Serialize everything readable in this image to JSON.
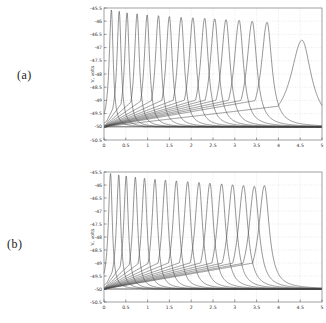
{
  "figure": {
    "background": "#ffffff"
  },
  "colors": {
    "curve": "#4f4f4f",
    "baseline": "#3f3f3f",
    "grid": "#d9d9d9",
    "axis": "#7a7a7a",
    "tick": "#555555",
    "text": "#333333"
  },
  "chart_data": [
    {
      "type": "line",
      "panel_label": "(a)",
      "title": "",
      "xlabel": "",
      "ylabel": "V, volts",
      "xlim": [
        0,
        5
      ],
      "ylim": [
        -50.5,
        -45.5
      ],
      "grid": true,
      "x_tick_values": [
        0,
        0.5,
        1,
        1.5,
        2,
        2.5,
        3,
        3.5,
        4,
        4.5,
        5
      ],
      "x_tick_labels": [
        "0",
        "0.5",
        "1",
        "1.5",
        "2",
        "2.5",
        "3",
        "3.5",
        "4",
        "4.5",
        "5"
      ],
      "y_tick_values": [
        -45.5,
        -46,
        -46.5,
        -47,
        -47.5,
        -48,
        -48.5,
        -49,
        -49.5,
        -50,
        -50.5
      ],
      "y_tick_labels": [
        "-45.5",
        "-46",
        "-46.5",
        "-47",
        "-47.5",
        "-48",
        "-48.5",
        "-49",
        "-49.5",
        "-50",
        "-50.5"
      ],
      "baseline_dB": -50,
      "width_model": {
        "core": [
          0.055,
          0.028
        ],
        "right": [
          0.045,
          0.024
        ],
        "ramp_fraction": 0.27
      },
      "peaks": [
        {
          "x": 0.17,
          "peak_dB": -45.57
        },
        {
          "x": 0.35,
          "peak_dB": -45.62
        },
        {
          "x": 0.53,
          "peak_dB": -45.68
        },
        {
          "x": 0.76,
          "peak_dB": -45.72
        },
        {
          "x": 0.99,
          "peak_dB": -45.76
        },
        {
          "x": 1.25,
          "peak_dB": -45.79
        },
        {
          "x": 1.5,
          "peak_dB": -45.82
        },
        {
          "x": 1.77,
          "peak_dB": -45.85
        },
        {
          "x": 2.04,
          "peak_dB": -45.87
        },
        {
          "x": 2.31,
          "peak_dB": -45.89
        },
        {
          "x": 2.54,
          "peak_dB": -45.91
        },
        {
          "x": 2.8,
          "peak_dB": -45.94
        },
        {
          "x": 3.1,
          "peak_dB": -45.97
        },
        {
          "x": 3.4,
          "peak_dB": -46.0
        },
        {
          "x": 3.74,
          "peak_dB": -46.04
        },
        {
          "x": 4.54,
          "peak_dB": -46.72,
          "w_scale": 1.7
        }
      ]
    },
    {
      "type": "line",
      "panel_label": "(b)",
      "title": "",
      "xlabel": "",
      "ylabel": "V, volts",
      "xlim": [
        0,
        5
      ],
      "ylim": [
        -50.5,
        -45.5
      ],
      "grid": true,
      "x_tick_values": [
        0,
        0.5,
        1,
        1.5,
        2,
        2.5,
        3,
        3.5,
        4,
        4.5,
        5
      ],
      "x_tick_labels": [
        "0",
        "0.5",
        "1",
        "1.5",
        "2",
        "2.5",
        "3",
        "3.5",
        "4",
        "4.5",
        "5"
      ],
      "y_tick_values": [
        -45.5,
        -46,
        -46.5,
        -47,
        -47.5,
        -48,
        -48.5,
        -49,
        -49.5,
        -50,
        -50.5
      ],
      "y_tick_labels": [
        "-45.5",
        "-46",
        "-46.5",
        "-47",
        "-47.5",
        "-48",
        "-48.5",
        "-49",
        "-49.5",
        "-50",
        "-50.5"
      ],
      "baseline_dB": -50,
      "width_model": {
        "core": [
          0.055,
          0.028
        ],
        "right": [
          0.045,
          0.024
        ],
        "ramp_fraction": 0.27
      },
      "peaks": [
        {
          "x": 0.15,
          "peak_dB": -45.55
        },
        {
          "x": 0.34,
          "peak_dB": -45.6
        },
        {
          "x": 0.51,
          "peak_dB": -45.65
        },
        {
          "x": 0.72,
          "peak_dB": -45.7
        },
        {
          "x": 0.93,
          "peak_dB": -45.74
        },
        {
          "x": 1.17,
          "peak_dB": -45.78
        },
        {
          "x": 1.41,
          "peak_dB": -45.81
        },
        {
          "x": 1.66,
          "peak_dB": -45.84
        },
        {
          "x": 1.92,
          "peak_dB": -45.87
        },
        {
          "x": 2.18,
          "peak_dB": -45.9
        },
        {
          "x": 2.43,
          "peak_dB": -45.93
        },
        {
          "x": 2.7,
          "peak_dB": -45.96
        },
        {
          "x": 2.95,
          "peak_dB": -45.99
        },
        {
          "x": 3.2,
          "peak_dB": -46.02
        },
        {
          "x": 3.45,
          "peak_dB": -46.05
        },
        {
          "x": 3.68,
          "peak_dB": -46.02
        }
      ]
    }
  ]
}
